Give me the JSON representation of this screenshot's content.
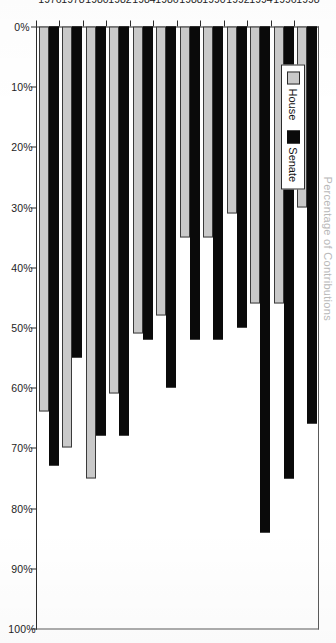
{
  "document": {
    "kind": "scanned-chart-page",
    "rotation_degrees": 90,
    "title_faint": "Percentage of Contributions"
  },
  "legend": {
    "position": "top-left",
    "entries": [
      {
        "label": "House",
        "color": "#c9c9c9",
        "icon": "square-swatch-gray"
      },
      {
        "label": "Senate",
        "color": "#0a0a0a",
        "icon": "square-swatch-black"
      }
    ]
  },
  "axes": {
    "value_axis": {
      "labels": [
        "0%",
        "10%",
        "20%",
        "30%",
        "40%",
        "50%",
        "60%",
        "70%",
        "80%",
        "90%",
        "100%"
      ],
      "values": [
        0,
        10,
        20,
        30,
        40,
        50,
        60,
        70,
        80,
        90,
        100
      ],
      "min": 0,
      "max": 100,
      "direction": "right-to-left"
    },
    "category_axis": {
      "labels": [
        "1976",
        "1978",
        "1980",
        "1982",
        "1984",
        "1986",
        "1988",
        "1990",
        "1992",
        "1994",
        "1996",
        "1998"
      ]
    }
  },
  "chart_data": {
    "type": "bar",
    "orientation": "horizontal",
    "title": "Percentage of Contributions",
    "subtitle": "",
    "xlabel": "",
    "ylabel": "",
    "xlim": [
      0,
      100
    ],
    "grid": false,
    "legend_position": "top-left",
    "categories": [
      "1976",
      "1978",
      "1980",
      "1982",
      "1984",
      "1986",
      "1988",
      "1990",
      "1992",
      "1994",
      "1996",
      "1998"
    ],
    "series": [
      {
        "name": "House",
        "color": "#c9c9c9",
        "values": [
          64,
          70,
          75,
          61,
          51,
          48,
          35,
          35,
          31,
          46,
          46,
          30
        ]
      },
      {
        "name": "Senate",
        "color": "#0a0a0a",
        "values": [
          73,
          55,
          68,
          68,
          52,
          60,
          52,
          52,
          50,
          84,
          75,
          66
        ]
      }
    ],
    "units": "percent",
    "value_labels_shown": false
  }
}
